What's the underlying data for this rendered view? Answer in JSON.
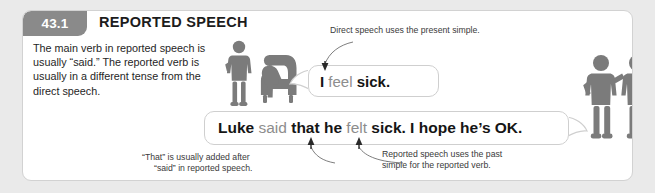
{
  "page": {
    "background_color": "#eaeaea",
    "card_background": "#ffffff",
    "accent_gray": "#8a8a8a",
    "figure_gray": "#7b7b7b"
  },
  "header": {
    "badge": "43.1",
    "title": "REPORTED SPEECH"
  },
  "intro": {
    "text": "The main verb in reported speech is usually “said.” The reported verb is usually in a different tense from the direct speech."
  },
  "bubbles": {
    "direct": {
      "name": "direct-speech-bubble",
      "full_text": "I feel sick.",
      "tokens": [
        {
          "text": "I ",
          "style": "bold"
        },
        {
          "text": "feel",
          "style": "gray"
        },
        {
          "text": " sick.",
          "style": "bold"
        }
      ]
    },
    "reported": {
      "name": "reported-speech-bubble",
      "full_text": "Luke said that he felt sick. I hope he’s OK.",
      "tokens": [
        {
          "text": "Luke ",
          "style": "bold"
        },
        {
          "text": "said",
          "style": "gray"
        },
        {
          "text": " that he ",
          "style": "bold"
        },
        {
          "text": "felt",
          "style": "gray"
        },
        {
          "text": " sick. I hope he’s OK.",
          "style": "bold"
        }
      ]
    }
  },
  "annotations": {
    "direct_note": "Direct speech uses the present simple.",
    "that_note_line1": "“That” is usually added after",
    "that_note_line2": "“said” in reported speech.",
    "past_note_line1": "Reported speech uses the past",
    "past_note_line2": "simple for the reported verb."
  },
  "figures": {
    "left_scene": "standing-person-and-seated-person-in-armchair",
    "right_scene": "two-standing-people"
  }
}
